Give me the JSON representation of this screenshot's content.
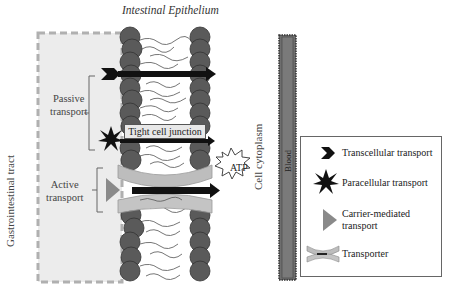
{
  "diagram": {
    "title": "Intestinal Epithelium",
    "regions": {
      "gastrointestinal": "Gastrointestinal tract",
      "cytoplasm": "Cell cytoplasm",
      "blood": "Blood"
    },
    "groups": {
      "passive": [
        "Passive",
        "transport"
      ],
      "active": [
        "Active",
        "transport"
      ]
    },
    "labels": {
      "tight_junction": "Tight cell junction",
      "atp": "ATP"
    },
    "colors": {
      "lipid_head": "#5a5a5a",
      "gi_box_fill": "#ececec",
      "gi_box_border": "#b0b0b0",
      "blood_bar": "#6e6e6e",
      "arrow": "#111111",
      "carrier_triangle": "#8a8a8a",
      "transporter": "#bdbdbd"
    }
  },
  "legend": {
    "items": [
      {
        "icon": "chevron-icon",
        "label": "Transcellular transport"
      },
      {
        "icon": "star-burst-icon",
        "label": "Paracellular transport"
      },
      {
        "icon": "triangle-icon",
        "label_lines": [
          "Carrier-mediated",
          "transport"
        ]
      },
      {
        "icon": "transporter-icon",
        "label": "Transporter"
      }
    ]
  }
}
